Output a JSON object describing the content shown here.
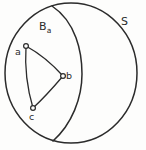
{
  "figure": {
    "kind": "spherical-geometry-diagram",
    "background_color": "#fdfdfc",
    "stroke_color": "#2b2b2b",
    "width": 146,
    "height": 150,
    "labels": {
      "sphere": "S",
      "region_base": "B",
      "region_subscript": "a",
      "vertex_a": "a",
      "vertex_b": "b",
      "vertex_c": "c"
    },
    "geometry": {
      "sphere_outline": {
        "name": "great-circle-outline",
        "center_x": 71,
        "center_y": 73,
        "radius_x": 66,
        "radius_y": 70
      },
      "great_circle_arc": {
        "name": "region-boundary-arc",
        "start": [
          52,
          6
        ],
        "bulge": [
          82,
          74
        ],
        "end": [
          53,
          141
        ]
      },
      "vertices": [
        {
          "id": "a",
          "x": 26,
          "y": 46,
          "r": 2.4
        },
        {
          "id": "b",
          "x": 63,
          "y": 76,
          "r": 2.4
        },
        {
          "id": "c",
          "x": 33,
          "y": 108,
          "r": 2.4
        }
      ],
      "edges": [
        {
          "id": "edge-ab",
          "from": "a",
          "to": "b",
          "control": [
            46,
            57
          ]
        },
        {
          "id": "edge-bc",
          "from": "b",
          "to": "c",
          "control": [
            46,
            96
          ]
        },
        {
          "id": "edge-ca",
          "from": "c",
          "to": "a",
          "control": [
            26,
            78
          ]
        }
      ]
    }
  }
}
